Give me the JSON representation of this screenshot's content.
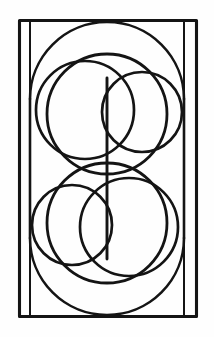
{
  "figure": {
    "title": "Geometric circle composition",
    "background_color": "#fefefe",
    "ink_color": "#141414",
    "canvas": {
      "width": 214,
      "height": 337
    },
    "elements": {
      "frame_label": "outer rectangle frame",
      "rail_left_label": "left inner vertical rail",
      "rail_right_label": "right inner vertical rail",
      "stadium_label": "stadium outline",
      "upper_big_label": "upper large circle",
      "upper_left_label": "upper left medium circle",
      "upper_right_label": "upper right small circle",
      "lower_big_label": "lower large circle",
      "lower_right_label": "lower right medium circle",
      "lower_left_label": "lower left small circle",
      "spine_label": "central vertical spine"
    },
    "geometry": {
      "frame": {
        "x": 19.5,
        "y": 20.5,
        "width": 177,
        "height": 296
      },
      "rail_left_x": 30,
      "rail_right_x": 184,
      "rail_top_y": 22,
      "rail_bottom_y": 315,
      "stadium": {
        "left_x": 30,
        "right_x": 184,
        "top_arc_center_y": 99,
        "bottom_arc_center_y": 238,
        "radius": 77
      },
      "upper_big": {
        "cx": 107,
        "cy": 114,
        "r": 60
      },
      "upper_left": {
        "cx": 85,
        "cy": 110,
        "r": 49
      },
      "upper_right": {
        "cx": 142,
        "cy": 112,
        "r": 40
      },
      "lower_big": {
        "cx": 107,
        "cy": 223,
        "r": 60
      },
      "lower_right": {
        "cx": 129,
        "cy": 227,
        "r": 49
      },
      "lower_left": {
        "cx": 72,
        "cy": 225,
        "r": 40
      },
      "spine": {
        "x": 107,
        "y_top": 78,
        "y_bottom": 259
      },
      "center": {
        "x": 107,
        "y": 168.5
      }
    }
  }
}
